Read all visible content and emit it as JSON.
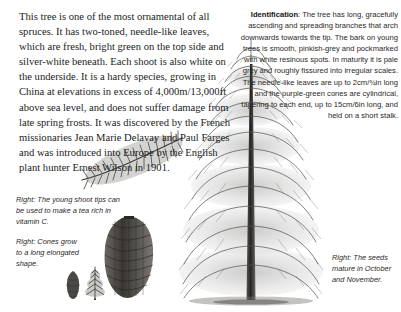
{
  "page": {
    "background": "#ffffff",
    "text_color": "#201d1b",
    "caption_color": "#2c2a28"
  },
  "body_text": {
    "paragraph": "This tree is one of the most ornamental of all spruces. It has two-toned, needle-like leaves, which are fresh, bright green on the top side and silver-white beneath. Each shoot is also white on the underside. It is a hardy species, growing in China at elevations in excess of 4,000m/13,000ft above sea level, and does not suffer damage from late spring frosts. It was discovered by the French missionaries Jean Marie Delavay and Paul Farges and was introduced into Europe by the English plant hunter Ernest Wilson in 1901."
  },
  "identification": {
    "heading": "Identification",
    "separator": ": ",
    "text": "The tree has long, gracefully ascending and spreading branches that arch downwards towards the tip. The bark on young trees is smooth, pinkish-grey and pockmarked with white resinous spots. In maturity it is pale grey and roughly fissured into irregular scales. The needle-like leaves are up to 2cm/¾in long and the purple-green cones are cylindrical, tapering to each end, up to 15cm/6in long, and held on a short stalk."
  },
  "captions": {
    "shoot": {
      "lead": "Right:",
      "text": " The young shoot tips can be used to make a tea rich in vitamin C."
    },
    "cones": {
      "lead": "Right:",
      "text": " Cones grow to a long elongated shape."
    },
    "seeds": {
      "lead": "Right:",
      "text": " The seeds mature in October and November."
    }
  },
  "figures": {
    "main_tree": "spruce-tree-illustration",
    "shoot": "needle-shoot-illustration",
    "cone": "large-cone-illustration",
    "cone_small": "small-cone-illustration",
    "sapling": "small-sapling-illustration"
  }
}
